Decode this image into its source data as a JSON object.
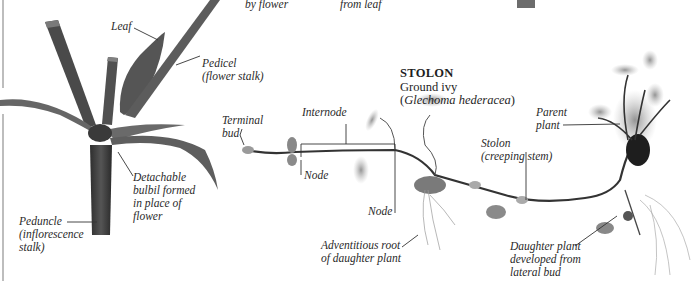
{
  "top_fragments": {
    "left": "by flower",
    "right": "from leaf"
  },
  "bulbil_diagram": {
    "labels": {
      "leaf": "Leaf",
      "pedicel_line1": "Pedicel",
      "pedicel_line2": "(flower stalk)",
      "bulbil_line1": "Detachable",
      "bulbil_line2": "bulbil formed",
      "bulbil_line3": "in place of",
      "bulbil_line4": "flower",
      "peduncle_line1": "Peduncle",
      "peduncle_line2": "(inflorescence",
      "peduncle_line3": "stalk)"
    }
  },
  "stolon_diagram": {
    "heading": "STOLON",
    "common_name": "Ground ivy",
    "scientific_name_open": "(",
    "scientific_name": "Glechoma hederacea",
    "scientific_name_close": ")",
    "labels": {
      "terminal_bud_line1": "Terminal",
      "terminal_bud_line2": "bud",
      "internode": "Internode",
      "node_1": "Node",
      "node_2": "Node",
      "adventitious_line1": "Adventitious root",
      "adventitious_line2": "of daughter plant",
      "stolon_line1": "Stolon",
      "stolon_line2": "(creeping stem)",
      "parent_line1": "Parent",
      "parent_line2": "plant",
      "daughter_line1": "Daughter plant",
      "daughter_line2": "developed from",
      "daughter_line3": "lateral bud"
    }
  },
  "colors": {
    "background": "#ffffff",
    "stem_dark": "#3b3b3b",
    "leaf_gray": "#7a7a7a",
    "leader_line": "#333333",
    "divider": "#9a9a9a"
  }
}
